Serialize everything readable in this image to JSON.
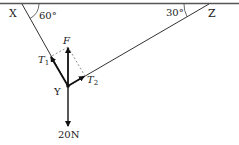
{
  "diagram": {
    "type": "force-diagram",
    "points": {
      "X": {
        "label": "X"
      },
      "Y": {
        "label": "Y"
      },
      "Z": {
        "label": "Z"
      }
    },
    "angles": {
      "at_X": "60°",
      "at_Z": "30°"
    },
    "forces": {
      "resultant": {
        "label": "F"
      },
      "tension_1": {
        "label": "T",
        "subscript": "1"
      },
      "tension_2": {
        "label": "T",
        "subscript": "2"
      },
      "weight": {
        "label": "20N"
      }
    },
    "colors": {
      "line": "#333333",
      "ceiling": "#555555",
      "dashed": "#777777",
      "text": "#222222"
    }
  }
}
